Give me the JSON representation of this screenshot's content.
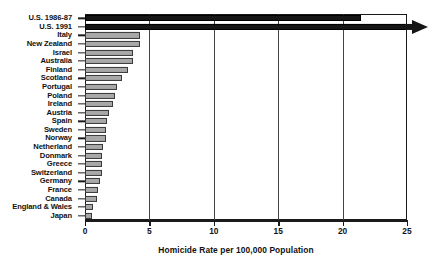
{
  "chart_data": {
    "type": "bar",
    "orientation": "horizontal",
    "title": "",
    "xlabel": "Homicide Rate per 100,000 Population",
    "ylabel": "",
    "xlim": [
      0,
      25
    ],
    "xticks": [
      0,
      5,
      10,
      15,
      20,
      25
    ],
    "grid": true,
    "grid_axis": "x",
    "legend": false,
    "categories": [
      "U.S. 1986-87",
      "U.S. 1991",
      "Italy",
      "New Zealand",
      "Israel",
      "Australia",
      "Finland",
      "Scotland",
      "Portugal",
      "Poland",
      "Ireland",
      "Austria",
      "Spain",
      "Sweden",
      "Norway",
      "Netherland",
      "Donmark",
      "Greece",
      "Switzerland",
      "Germany",
      "France",
      "Canada",
      "England & Wales",
      "Japan"
    ],
    "values": [
      21.4,
      25.0,
      4.3,
      4.3,
      3.7,
      3.7,
      3.3,
      2.9,
      2.5,
      2.3,
      2.2,
      1.9,
      1.7,
      1.6,
      1.6,
      1.4,
      1.3,
      1.3,
      1.3,
      1.2,
      1.0,
      0.9,
      0.6,
      0.55
    ],
    "bar_styles": [
      "dark",
      "dark",
      "gray",
      "gray",
      "gray",
      "gray",
      "gray",
      "gray",
      "gray",
      "gray",
      "gray",
      "gray",
      "gray",
      "gray",
      "gray",
      "gray",
      "gray",
      "gray",
      "gray",
      "gray",
      "gray",
      "gray",
      "gray",
      "gray"
    ],
    "overflow_bars": [
      1
    ],
    "colors": {
      "bar_gray_fill": "#a8a8a8",
      "bar_gray_edge": "#3a3a3a",
      "bar_dark_fill": "#161616",
      "axis": "#1a1a1a",
      "grid": "#444444",
      "text": "#111111",
      "background": "#ffffff"
    }
  }
}
